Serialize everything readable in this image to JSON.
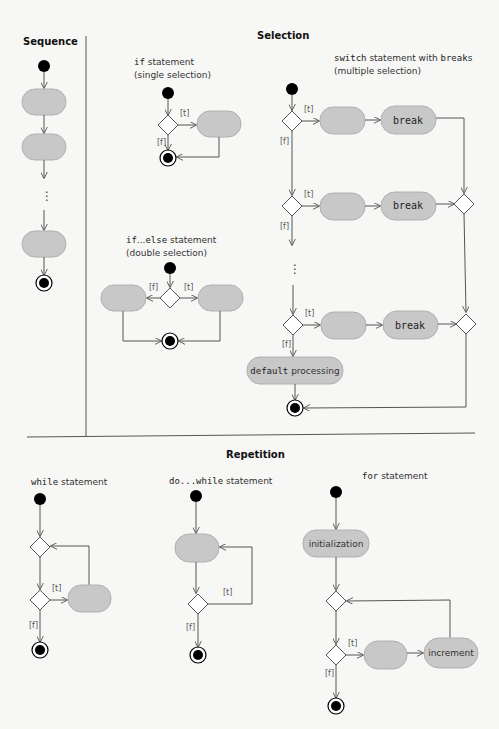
{
  "sections": {
    "sequence": {
      "title": "Sequence"
    },
    "selection": {
      "title": "Selection",
      "if": {
        "keyword": "if",
        "label": " statement",
        "sub": "(single selection)"
      },
      "if_else": {
        "keyword_if": "if",
        "dots": "...",
        "keyword_else": "else",
        "label": " statement",
        "sub": "(double selection)"
      },
      "switch": {
        "keyword": "switch",
        "label_mid": " statement with ",
        "keyword_breaks": "break",
        "label_end": "s",
        "sub": "(multiple selection)",
        "break_label": "break",
        "default_keyword": "default",
        "default_label": " processing"
      }
    },
    "repetition": {
      "title": "Repetition",
      "while": {
        "keyword": "while",
        "label": " statement"
      },
      "do_while": {
        "prefix": "do...",
        "keyword": "while",
        "label": " statement"
      },
      "for": {
        "keyword": "for",
        "label": " statement",
        "init_label": "initialization",
        "increment_label": "increment"
      }
    }
  },
  "guards": {
    "true": "[t]",
    "false": "[f]"
  },
  "ellipsis": "⋮",
  "colors": {
    "action_fill": "#c8c8c8",
    "line": "#555555",
    "background": "#f7f7f5"
  }
}
